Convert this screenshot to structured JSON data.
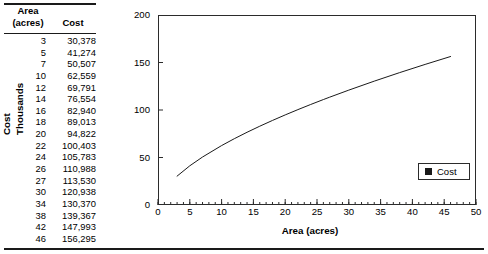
{
  "table": {
    "headers": {
      "col1_line1": "Area",
      "col1_line2": "(acres)",
      "col2": "Cost"
    },
    "rows": [
      {
        "area": "3",
        "cost": "30,378"
      },
      {
        "area": "5",
        "cost": "41,274"
      },
      {
        "area": "7",
        "cost": "50,507"
      },
      {
        "area": "10",
        "cost": "62,559"
      },
      {
        "area": "12",
        "cost": "69,791"
      },
      {
        "area": "14",
        "cost": "76,554"
      },
      {
        "area": "16",
        "cost": "82,940"
      },
      {
        "area": "18",
        "cost": "89,013"
      },
      {
        "area": "20",
        "cost": "94,822"
      },
      {
        "area": "22",
        "cost": "100,403"
      },
      {
        "area": "24",
        "cost": "105,783"
      },
      {
        "area": "26",
        "cost": "110,988"
      },
      {
        "area": "27",
        "cost": "113,530"
      },
      {
        "area": "30",
        "cost": "120,938"
      },
      {
        "area": "34",
        "cost": "130,370"
      },
      {
        "area": "38",
        "cost": "139,367"
      },
      {
        "area": "42",
        "cost": "147,993"
      },
      {
        "area": "46",
        "cost": "156,295"
      }
    ]
  },
  "chart_data": {
    "type": "line",
    "title": "",
    "xlabel": "Area (acres)",
    "ylabel_line1": "Cost",
    "ylabel_line2": "Thousands",
    "xlim": [
      0,
      50
    ],
    "ylim": [
      0,
      200
    ],
    "xticks": [
      "0",
      "5",
      "10",
      "15",
      "20",
      "25",
      "30",
      "35",
      "40",
      "45",
      "50"
    ],
    "yticks": [
      "0",
      "50",
      "100",
      "150",
      "200"
    ],
    "x_minor_tick_step": 1,
    "grid": false,
    "legend_position": "bottom-right",
    "series": [
      {
        "name": "Cost",
        "marker_color": "#1a1a1a",
        "line_color": "#1a1a1a",
        "x": [
          3,
          5,
          7,
          10,
          12,
          14,
          16,
          18,
          20,
          22,
          24,
          26,
          27,
          30,
          34,
          38,
          42,
          46
        ],
        "values": [
          30.378,
          41.274,
          50.507,
          62.559,
          69.791,
          76.554,
          82.94,
          89.013,
          94.822,
          100.403,
          105.783,
          110.988,
          113.53,
          120.938,
          130.37,
          139.367,
          147.993,
          156.295
        ]
      }
    ],
    "legend": [
      {
        "label": "Cost",
        "swatch": "#1a1a1a"
      }
    ]
  },
  "colors": {
    "ink": "#1a1a1a",
    "frame": "#2b2b2b",
    "background": "#ffffff"
  }
}
